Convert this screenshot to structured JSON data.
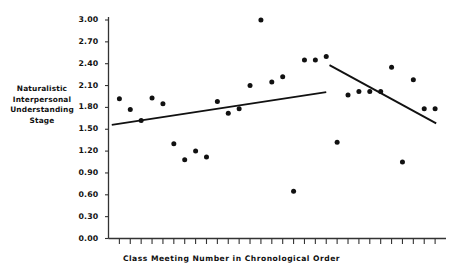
{
  "chart_data": {
    "type": "scatter",
    "title": "",
    "xlabel": "Class Meeting Number in Chronological Order",
    "ylabel": "Naturalistic Interpersonal Understanding Stage",
    "ylabel_lines": [
      "Naturalistic",
      "Interpersonal",
      "Understanding",
      "Stage"
    ],
    "ylim": [
      0.0,
      3.0
    ],
    "ytick_labels": [
      "3.00",
      "2.70",
      "2.40",
      "2.10",
      "1.80",
      "1.50",
      "1.20",
      "0.90",
      "0.60",
      "0.30",
      "0.00"
    ],
    "ytick_values": [
      3.0,
      2.7,
      2.4,
      2.1,
      1.8,
      1.5,
      1.2,
      0.9,
      0.6,
      0.3,
      0.0
    ],
    "xlim": [
      0,
      31
    ],
    "xtick_labels": [],
    "xtick_count": 30,
    "grid": false,
    "legend": false,
    "marker_color": "#111111",
    "line_color": "#111111",
    "axis_color": "#333333",
    "x": [
      1,
      2,
      3,
      4,
      5,
      6,
      7,
      8,
      9,
      10,
      11,
      12,
      13,
      14,
      15,
      16,
      17,
      18,
      19,
      20,
      21,
      22,
      23,
      24,
      25,
      26,
      27,
      28,
      29,
      30
    ],
    "values": [
      1.92,
      1.77,
      1.62,
      1.93,
      1.85,
      1.3,
      1.08,
      1.2,
      1.12,
      1.88,
      1.72,
      1.78,
      2.1,
      3.0,
      2.15,
      2.22,
      0.65,
      2.45,
      2.45,
      2.5,
      1.32,
      1.97,
      2.02,
      2.02,
      2.02,
      2.35,
      1.05,
      2.18,
      1.78,
      1.78
    ],
    "points": [
      {
        "x": 1,
        "y": 1.92
      },
      {
        "x": 2,
        "y": 1.77
      },
      {
        "x": 3,
        "y": 1.62
      },
      {
        "x": 4,
        "y": 1.93
      },
      {
        "x": 5,
        "y": 1.85
      },
      {
        "x": 6,
        "y": 1.3
      },
      {
        "x": 7,
        "y": 1.08
      },
      {
        "x": 8,
        "y": 1.2
      },
      {
        "x": 9,
        "y": 1.12
      },
      {
        "x": 10,
        "y": 1.88
      },
      {
        "x": 11,
        "y": 1.72
      },
      {
        "x": 12,
        "y": 1.78
      },
      {
        "x": 13,
        "y": 2.1
      },
      {
        "x": 14,
        "y": 3.0
      },
      {
        "x": 15,
        "y": 2.15
      },
      {
        "x": 16,
        "y": 2.22
      },
      {
        "x": 17,
        "y": 0.65
      },
      {
        "x": 18,
        "y": 2.45
      },
      {
        "x": 19,
        "y": 2.45
      },
      {
        "x": 20,
        "y": 2.5
      },
      {
        "x": 21,
        "y": 1.32
      },
      {
        "x": 22,
        "y": 1.97
      },
      {
        "x": 23,
        "y": 2.02
      },
      {
        "x": 24,
        "y": 2.02
      },
      {
        "x": 25,
        "y": 2.02
      },
      {
        "x": 26,
        "y": 2.35
      },
      {
        "x": 27,
        "y": 1.05
      },
      {
        "x": 28,
        "y": 2.18
      },
      {
        "x": 29,
        "y": 1.78
      },
      {
        "x": 30,
        "y": 1.78
      }
    ],
    "trend_lines": [
      {
        "name": "ascending-segment",
        "x_start": 0.3,
        "y_start": 1.56,
        "x_end": 20.0,
        "y_end": 2.01
      },
      {
        "name": "descending-segment",
        "x_start": 20.3,
        "y_start": 2.38,
        "x_end": 30.1,
        "y_end": 1.58
      }
    ]
  }
}
